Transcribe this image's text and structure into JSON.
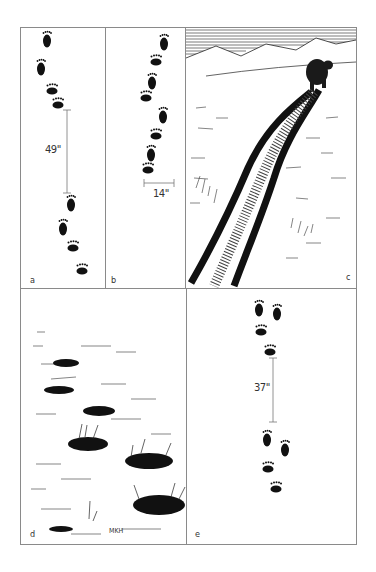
{
  "figure": {
    "panels": [
      {
        "id": "a",
        "label": "a",
        "subject": "bear-track-sequence",
        "measurement": "49\""
      },
      {
        "id": "b",
        "label": "b",
        "subject": "bear-track-walking-sequence",
        "measurement": "14\""
      },
      {
        "id": "c",
        "label": "c",
        "subject": "bear-walking-worn-trail-illustration"
      },
      {
        "id": "d",
        "label": "d",
        "subject": "depressions-in-tundra-illustration",
        "signature": "MKH"
      },
      {
        "id": "e",
        "label": "e",
        "subject": "bear-track-sequence",
        "measurement": "37\""
      }
    ]
  },
  "colors": {
    "ink": "#111111",
    "border": "#8a8a8a",
    "background": "#ffffff"
  }
}
